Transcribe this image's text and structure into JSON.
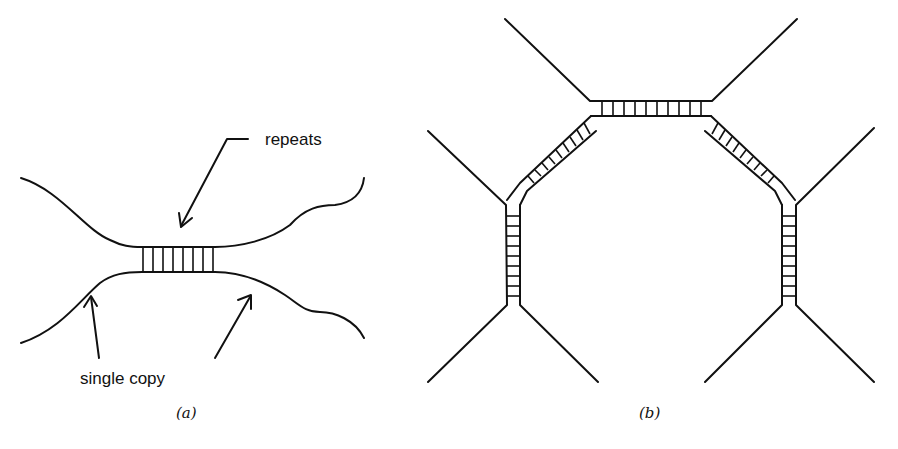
{
  "figure": {
    "panel_a": {
      "caption": "(a)",
      "labels": {
        "repeats": "repeats",
        "single_copy": "single copy"
      },
      "description": "Two single-copy strands joined by a short block of repeats (ladder rungs)",
      "rung_count": 8
    },
    "panel_b": {
      "caption": "(b)",
      "description": "Four strands with paired repeat regions forming a closed octagonal structure",
      "ladders": [
        {
          "name": "top",
          "rungs": 10
        },
        {
          "name": "upper-left-diagonal",
          "rungs": 9
        },
        {
          "name": "upper-right-diagonal",
          "rungs": 9
        },
        {
          "name": "left-vertical",
          "rungs": 9
        },
        {
          "name": "right-vertical",
          "rungs": 9
        }
      ]
    },
    "colors": {
      "ink": "#111111",
      "background": "#ffffff"
    }
  }
}
